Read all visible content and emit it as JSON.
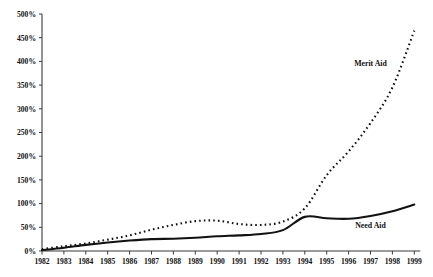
{
  "chart_data": {
    "type": "line",
    "title": "",
    "xlabel": "",
    "ylabel": "",
    "ylim": [
      0,
      500
    ],
    "yticks": [
      0,
      50,
      100,
      150,
      200,
      250,
      300,
      350,
      400,
      450,
      500
    ],
    "ytick_labels": [
      "0%",
      "50%",
      "100%",
      "150%",
      "200%",
      "250%",
      "300%",
      "350%",
      "400%",
      "450%",
      "500%"
    ],
    "grid": false,
    "legend_position": "inline-annotation",
    "categories": [
      1982,
      1983,
      1984,
      1985,
      1986,
      1987,
      1988,
      1989,
      1990,
      1991,
      1992,
      1993,
      1994,
      1995,
      1996,
      1997,
      1998,
      1999
    ],
    "xtick_labels": [
      "1982",
      "1983",
      "1984",
      "1985",
      "1986",
      "1987",
      "1988",
      "1989",
      "1990",
      "1991",
      "1992",
      "1993",
      "1994",
      "1995",
      "1996",
      "1997",
      "1998",
      "1999"
    ],
    "series": [
      {
        "name": "Merit Aid",
        "style": "dotted",
        "color": "#111111",
        "label_x_year": 1997,
        "label_y_value": 390,
        "values": [
          4,
          10,
          16,
          24,
          33,
          45,
          55,
          63,
          64,
          57,
          55,
          62,
          90,
          160,
          210,
          270,
          345,
          465
        ]
      },
      {
        "name": "Need Aid",
        "style": "solid",
        "color": "#111111",
        "label_x_year": 1997,
        "label_y_value": 48,
        "values": [
          2,
          7,
          13,
          18,
          22,
          25,
          26,
          28,
          31,
          33,
          36,
          44,
          72,
          69,
          68,
          74,
          84,
          98
        ]
      }
    ]
  }
}
